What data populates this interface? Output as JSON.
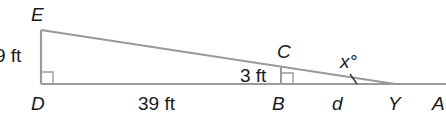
{
  "diagram": {
    "type": "similar-right-triangles",
    "colors": {
      "line": "#9a9a9a",
      "text": "#1a1a1a",
      "background": "#ffffff"
    },
    "points": {
      "E": "E",
      "D": "D",
      "C": "C",
      "B": "B",
      "Y": "Y",
      "A": "A"
    },
    "measurements": {
      "ED": "9 ft",
      "DB": "39 ft",
      "CB": "3 ft",
      "BY": "d"
    },
    "angle": {
      "label": "x°",
      "variable": "x",
      "unit": "°"
    }
  }
}
